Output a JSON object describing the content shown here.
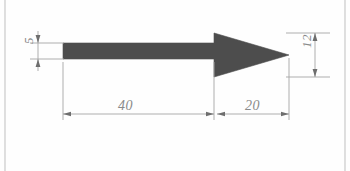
{
  "drawing": {
    "title": "Arrow profile dimensioned drawing",
    "units_note": "",
    "background_color": "#fefefe",
    "part_fill_color": "#4d4d4d",
    "line_color": "#9a9a9a",
    "text_color": "#8a8a8a",
    "sheet_border": {
      "left_line_x": 5,
      "right_line_x": 345,
      "color": "#c8c8c8"
    },
    "part": {
      "name": "arrow",
      "shaft": {
        "x_start": 63,
        "x_end": 214,
        "y_top": 43,
        "y_bottom": 59
      },
      "head": {
        "x_base": 214,
        "x_tip": 289,
        "y_top": 33,
        "y_bottom": 77
      }
    },
    "dimensions": [
      {
        "id": "dim-5",
        "label": "5",
        "value": 5,
        "orientation": "vertical",
        "location": "left",
        "measures": "shaft thickness"
      },
      {
        "id": "dim-12",
        "label": "12",
        "value": 12,
        "orientation": "vertical",
        "location": "right",
        "measures": "arrowhead base width"
      },
      {
        "id": "dim-40",
        "label": "40",
        "value": 40,
        "orientation": "horizontal",
        "location": "bottom-left",
        "measures": "shaft length"
      },
      {
        "id": "dim-20",
        "label": "20",
        "value": 20,
        "orientation": "horizontal",
        "location": "bottom-right",
        "measures": "arrowhead length"
      }
    ]
  }
}
